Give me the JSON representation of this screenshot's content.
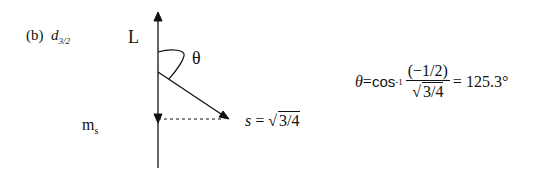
{
  "part_label": {
    "prefix": "(b)",
    "orbital": "d",
    "subscript": "3/2"
  },
  "vector_labels": {
    "L": "L",
    "theta": "θ",
    "ms": "m",
    "ms_sub": "s"
  },
  "spin": {
    "var": "s",
    "eq": " = ",
    "sqrt_content": "3/4"
  },
  "formula": {
    "lhs": "θ",
    "eq": " = ",
    "func": "cos",
    "func_sup": "-1",
    "numerator": "(−1/2)",
    "denominator_sqrt": "3/4",
    "result": "= 125.3°"
  },
  "colors": {
    "ink": "#111111",
    "background": "#ffffff"
  }
}
